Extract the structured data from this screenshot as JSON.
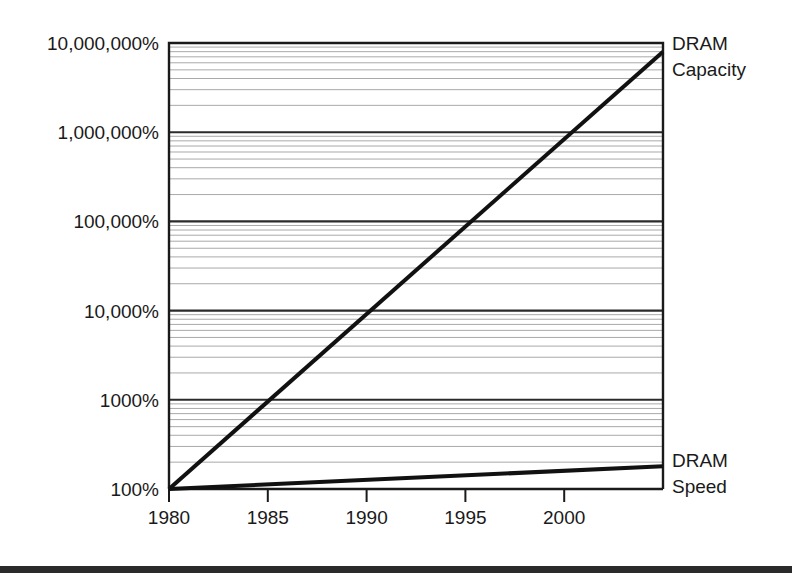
{
  "chart_data": {
    "type": "line",
    "title": "",
    "subtitle": "",
    "xlabel": "",
    "ylabel": "",
    "yscale": "log",
    "xlim": [
      1980,
      2005
    ],
    "ylim": [
      100,
      10000000
    ],
    "grid": true,
    "minor_grid": true,
    "legend_position": "right-inline",
    "x_ticks": [
      1980,
      1985,
      1990,
      1995,
      2000
    ],
    "x_tick_labels": [
      "1980",
      "1985",
      "1990",
      "1995",
      "2000"
    ],
    "y_ticks": [
      100,
      1000,
      10000,
      100000,
      1000000,
      10000000
    ],
    "y_tick_labels": [
      "100%",
      "1000%",
      "10,000%",
      "100,000%",
      "1,000,000%",
      "10,000,000%"
    ],
    "series": [
      {
        "name": "DRAM Capacity",
        "label": "DRAM\nCapacity",
        "label_line1": "DRAM",
        "label_line2": "Capacity",
        "color": "#111111",
        "x": [
          1980,
          2005
        ],
        "values": [
          100,
          8000000
        ],
        "annotation": "straight on log axis (exponential growth)"
      },
      {
        "name": "DRAM Speed",
        "label": "DRAM\nSpeed",
        "label_line1": "DRAM",
        "label_line2": "Speed",
        "color": "#111111",
        "x": [
          1980,
          2005
        ],
        "values": [
          100,
          180
        ],
        "annotation": "nearly flat relative to capacity"
      }
    ]
  },
  "axis": {
    "y_labels": [
      "10,000,000%",
      "1,000,000%",
      "100,000%",
      "10,000%",
      "1000%",
      "100%"
    ],
    "x_labels": [
      "1980",
      "1985",
      "1990",
      "1995",
      "2000"
    ]
  },
  "annotations": {
    "capacity_line1": "DRAM",
    "capacity_line2": "Capacity",
    "speed_line1": "DRAM",
    "speed_line2": "Speed"
  },
  "colors": {
    "line": "#111111",
    "major_grid": "#2b2b2b",
    "minor_grid": "#9a9a9a",
    "axis": "#1a1a1a",
    "background": "#ffffff",
    "footer_band": "#2a2a2a"
  }
}
